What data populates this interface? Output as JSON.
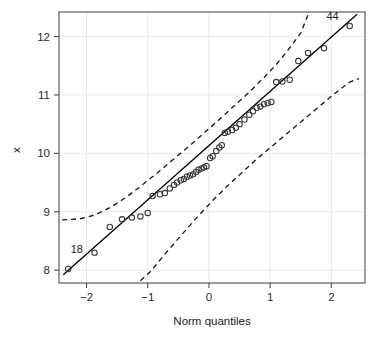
{
  "chart_data": {
    "type": "scatter",
    "title": "",
    "subtitle": "",
    "xlabel": "Norm quantiles",
    "ylabel": "x",
    "xlim": [
      -2.45,
      2.55
    ],
    "ylim": [
      7.78,
      12.42
    ],
    "xticks": [
      -2,
      -1,
      0,
      1,
      2
    ],
    "xticklabels": [
      "−2",
      "−1",
      "0",
      "1",
      "2"
    ],
    "yticks": [
      8,
      9,
      10,
      11,
      12
    ],
    "yticklabels": [
      "8",
      "9",
      "10",
      "11",
      "12"
    ],
    "grid": true,
    "grid_color": "#e9e9e9",
    "legend": null,
    "marker": "open-circle",
    "marker_color": "#333333",
    "line_color": "#000000",
    "band_color": "#1a1a1a",
    "band_style": "dashed",
    "points": [
      {
        "x": -2.3,
        "y": 8.02
      },
      {
        "x": -1.87,
        "y": 8.3
      },
      {
        "x": -1.62,
        "y": 8.74
      },
      {
        "x": -1.42,
        "y": 8.87
      },
      {
        "x": -1.26,
        "y": 8.9
      },
      {
        "x": -1.12,
        "y": 8.92
      },
      {
        "x": -1.0,
        "y": 8.98
      },
      {
        "x": -0.92,
        "y": 9.27
      },
      {
        "x": -0.8,
        "y": 9.3
      },
      {
        "x": -0.72,
        "y": 9.32
      },
      {
        "x": -0.64,
        "y": 9.4
      },
      {
        "x": -0.57,
        "y": 9.46
      },
      {
        "x": -0.52,
        "y": 9.5
      },
      {
        "x": -0.46,
        "y": 9.54
      },
      {
        "x": -0.41,
        "y": 9.56
      },
      {
        "x": -0.36,
        "y": 9.6
      },
      {
        "x": -0.31,
        "y": 9.62
      },
      {
        "x": -0.26,
        "y": 9.64
      },
      {
        "x": -0.21,
        "y": 9.68
      },
      {
        "x": -0.17,
        "y": 9.72
      },
      {
        "x": -0.12,
        "y": 9.74
      },
      {
        "x": -0.08,
        "y": 9.76
      },
      {
        "x": -0.04,
        "y": 9.78
      },
      {
        "x": 0.02,
        "y": 9.92
      },
      {
        "x": 0.06,
        "y": 9.95
      },
      {
        "x": 0.12,
        "y": 10.04
      },
      {
        "x": 0.17,
        "y": 10.1
      },
      {
        "x": 0.21,
        "y": 10.14
      },
      {
        "x": 0.26,
        "y": 10.35
      },
      {
        "x": 0.31,
        "y": 10.37
      },
      {
        "x": 0.38,
        "y": 10.4
      },
      {
        "x": 0.44,
        "y": 10.44
      },
      {
        "x": 0.5,
        "y": 10.5
      },
      {
        "x": 0.58,
        "y": 10.58
      },
      {
        "x": 0.66,
        "y": 10.66
      },
      {
        "x": 0.72,
        "y": 10.72
      },
      {
        "x": 0.78,
        "y": 10.78
      },
      {
        "x": 0.84,
        "y": 10.8
      },
      {
        "x": 0.9,
        "y": 10.84
      },
      {
        "x": 0.96,
        "y": 10.86
      },
      {
        "x": 1.02,
        "y": 10.88
      },
      {
        "x": 1.1,
        "y": 11.22
      },
      {
        "x": 1.2,
        "y": 11.23
      },
      {
        "x": 1.32,
        "y": 11.26
      },
      {
        "x": 1.46,
        "y": 11.58
      },
      {
        "x": 1.62,
        "y": 11.72
      },
      {
        "x": 1.88,
        "y": 11.8
      },
      {
        "x": 2.3,
        "y": 12.18
      }
    ],
    "reference_line": {
      "style": "solid",
      "x1": -2.38,
      "y1": 7.92,
      "x2": 2.42,
      "y2": 12.38
    },
    "upper_band": [
      {
        "x": -2.4,
        "y": 8.86
      },
      {
        "x": -2.1,
        "y": 8.88
      },
      {
        "x": -1.85,
        "y": 8.95
      },
      {
        "x": -1.6,
        "y": 9.08
      },
      {
        "x": -1.35,
        "y": 9.25
      },
      {
        "x": -1.1,
        "y": 9.45
      },
      {
        "x": -0.85,
        "y": 9.66
      },
      {
        "x": -0.6,
        "y": 9.88
      },
      {
        "x": -0.35,
        "y": 10.1
      },
      {
        "x": -0.1,
        "y": 10.33
      },
      {
        "x": 0.15,
        "y": 10.56
      },
      {
        "x": 0.4,
        "y": 10.8
      },
      {
        "x": 0.65,
        "y": 11.04
      },
      {
        "x": 0.9,
        "y": 11.3
      },
      {
        "x": 1.1,
        "y": 11.52
      },
      {
        "x": 1.3,
        "y": 11.78
      },
      {
        "x": 1.5,
        "y": 12.06
      },
      {
        "x": 1.63,
        "y": 12.4
      }
    ],
    "lower_band": [
      {
        "x": -1.12,
        "y": 7.82
      },
      {
        "x": -0.95,
        "y": 7.98
      },
      {
        "x": -0.7,
        "y": 8.3
      },
      {
        "x": -0.45,
        "y": 8.6
      },
      {
        "x": -0.2,
        "y": 8.9
      },
      {
        "x": 0.05,
        "y": 9.18
      },
      {
        "x": 0.3,
        "y": 9.44
      },
      {
        "x": 0.55,
        "y": 9.68
      },
      {
        "x": 0.8,
        "y": 9.92
      },
      {
        "x": 1.05,
        "y": 10.14
      },
      {
        "x": 1.3,
        "y": 10.36
      },
      {
        "x": 1.55,
        "y": 10.58
      },
      {
        "x": 1.8,
        "y": 10.8
      },
      {
        "x": 2.05,
        "y": 11.02
      },
      {
        "x": 2.3,
        "y": 11.22
      },
      {
        "x": 2.45,
        "y": 11.28
      }
    ],
    "annotations": [
      {
        "text": "18",
        "x": -2.16,
        "y": 8.3,
        "name": "point-label-18"
      },
      {
        "text": "44",
        "x": 2.02,
        "y": 12.28,
        "name": "point-label-44"
      }
    ]
  }
}
